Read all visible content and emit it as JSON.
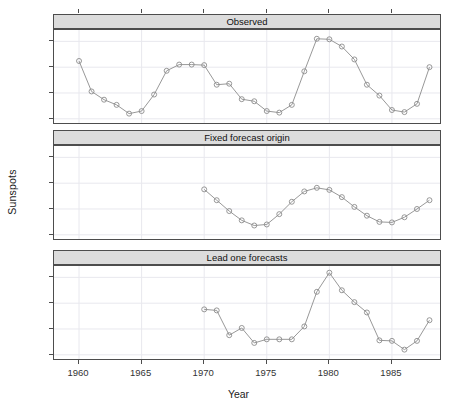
{
  "axes": {
    "ylabel": "Sunspots",
    "xlabel": "Year",
    "yticks": [
      "0",
      "50",
      "100",
      "150"
    ],
    "xticks": [
      "1960",
      "1965",
      "1970",
      "1975",
      "1980",
      "1985"
    ]
  },
  "panels": [
    {
      "title": "Observed"
    },
    {
      "title": "Fixed forecast origin"
    },
    {
      "title": "Lead one forecasts"
    }
  ],
  "chart_data": [
    {
      "type": "line",
      "title": "Observed",
      "xlabel": "Year",
      "ylabel": "Sunspots",
      "xlim": [
        1958,
        1989
      ],
      "ylim": [
        -12,
        172
      ],
      "grid": true,
      "marker": "open-circle",
      "x": [
        1960,
        1961,
        1962,
        1963,
        1964,
        1965,
        1966,
        1967,
        1968,
        1969,
        1970,
        1971,
        1972,
        1973,
        1974,
        1975,
        1976,
        1977,
        1978,
        1979,
        1980,
        1981,
        1982,
        1983,
        1984,
        1985,
        1986,
        1987,
        1988
      ],
      "values": [
        112,
        53,
        37,
        27,
        10,
        15,
        47,
        93,
        105,
        105,
        104,
        66,
        68,
        38,
        34,
        15,
        12,
        27,
        92,
        155,
        154,
        140,
        115,
        66,
        45,
        17,
        13,
        29,
        100
      ]
    },
    {
      "type": "line",
      "title": "Fixed forecast origin",
      "xlabel": "Year",
      "ylabel": "Sunspots",
      "xlim": [
        1958,
        1989
      ],
      "ylim": [
        -12,
        172
      ],
      "grid": true,
      "marker": "open-circle",
      "x": [
        1970,
        1971,
        1972,
        1973,
        1974,
        1975,
        1976,
        1977,
        1978,
        1979,
        1980,
        1981,
        1982,
        1983,
        1984,
        1985,
        1986,
        1987,
        1988
      ],
      "values": [
        88,
        67,
        46,
        28,
        18,
        20,
        40,
        64,
        84,
        91,
        87,
        73,
        54,
        37,
        25,
        24,
        34,
        50,
        67
      ]
    },
    {
      "type": "line",
      "title": "Lead one forecasts",
      "xlabel": "Year",
      "ylabel": "Sunspots",
      "xlim": [
        1958,
        1989
      ],
      "ylim": [
        -12,
        172
      ],
      "grid": true,
      "marker": "open-circle",
      "x": [
        1970,
        1971,
        1972,
        1973,
        1974,
        1975,
        1976,
        1977,
        1978,
        1979,
        1980,
        1981,
        1982,
        1983,
        1984,
        1985,
        1986,
        1987,
        1988
      ],
      "values": [
        88,
        86,
        38,
        52,
        23,
        30,
        30,
        30,
        55,
        122,
        159,
        125,
        102,
        82,
        28,
        27,
        10,
        27,
        67
      ]
    }
  ],
  "style": {
    "strip_fill": "#dcdcdc",
    "border": "#4d4d4d",
    "line": "#8c8c8c",
    "marker_stroke": "#8c8c8c",
    "grid": "#e8e8ee",
    "text": "#222222"
  }
}
